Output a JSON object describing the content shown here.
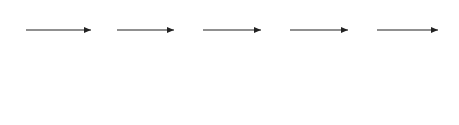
{
  "signal_labels": [
    "Y_r(s) = 1/s",
    "X_1(s)",
    "X_2(s)",
    "X_3(s)",
    "X_4(s)"
  ],
  "input_label": {
    "main": "Y",
    "sub": "r",
    "rest": "(s) = 1/s"
  },
  "signals": [
    {
      "main": "X",
      "sub": "1",
      "rest": "(s)"
    },
    {
      "main": "X",
      "sub": "2",
      "rest": "(s)"
    },
    {
      "main": "X",
      "sub": "3",
      "rest": "(s)"
    },
    {
      "main": "X",
      "sub": "4",
      "rest": "(s)"
    }
  ],
  "blocks": [
    {
      "num": "1",
      "den": "s+1"
    },
    {
      "num": "1",
      "den": "s+1"
    },
    {
      "num": "1",
      "den": "s+1"
    },
    {
      "num": "1",
      "den": "s+1"
    }
  ],
  "plots": [
    {
      "label_main": "y",
      "label_sub": "r",
      "label_rest": "(t)",
      "label_line2": "= h(t)"
    },
    {
      "label_main": "x",
      "label_sub": "1",
      "label_rest": "(t)"
    },
    {
      "label_main": "x",
      "label_sub": "2",
      "label_rest": "(t)"
    },
    {
      "label_main": "x",
      "label_sub": "3",
      "label_rest": "(t)"
    },
    {
      "label_main": "x",
      "label_sub": "4",
      "label_rest": "(t)"
    }
  ],
  "axes": {
    "y_ticks": [
      "0",
      "0.5",
      "1"
    ],
    "x_ticks": [
      "0",
      "5",
      "10"
    ],
    "x_unit": "t[s]"
  },
  "chart_data": {
    "type": "line",
    "xlabel": "t [s]",
    "ylabel": "",
    "xlim": [
      0,
      10
    ],
    "ylim": [
      0,
      1
    ],
    "series": [
      {
        "name": "y_r(t) = h(t)",
        "formula": "1"
      },
      {
        "name": "x_1(t)",
        "formula": "1 - e^-t"
      },
      {
        "name": "x_2(t)",
        "formula": "1 - e^-t(1+t)"
      },
      {
        "name": "x_3(t)",
        "formula": "1 - e^-t(1+t+t^2/2)"
      },
      {
        "name": "x_4(t)",
        "formula": "1 - e^-t(1+t+t^2/2+t^3/6)"
      }
    ]
  }
}
